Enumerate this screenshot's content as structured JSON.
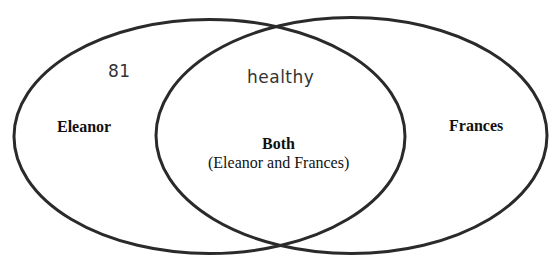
{
  "diagram": {
    "type": "venn",
    "sets": [
      {
        "id": "eleanor",
        "label": "Eleanor",
        "entries": [
          "81"
        ]
      },
      {
        "id": "frances",
        "label": "Frances",
        "entries": []
      }
    ],
    "intersection": {
      "label": "Both",
      "sublabel": "(Eleanor and Frances)",
      "entries": [
        "healthy"
      ]
    },
    "colors": {
      "stroke": "#2a2a2a",
      "text": "#111111",
      "handwriting": "#333333",
      "background": "#ffffff"
    }
  }
}
